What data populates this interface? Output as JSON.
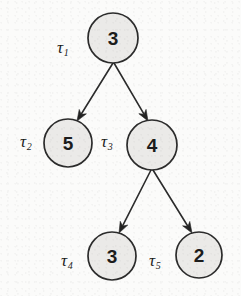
{
  "figure": {
    "type": "tree-diagram",
    "title": "",
    "background_color": "#fbfbfa",
    "node_fill_color": "#ebeae8",
    "node_stroke_color": "#2b2b2b",
    "edge_color": "#2b2b2b",
    "text_color": "#1c1c1c"
  },
  "nodes": [
    {
      "id": "n1",
      "value": "3",
      "tau": "τ",
      "tau_sub": "1",
      "cx": 113,
      "cy": 38,
      "r": 25,
      "label_x": 57,
      "label_y": 39
    },
    {
      "id": "n2",
      "value": "5",
      "tau": "τ",
      "tau_sub": "2",
      "cx": 68,
      "cy": 143,
      "r": 24,
      "label_x": 20,
      "label_y": 133
    },
    {
      "id": "n3",
      "value": "4",
      "tau": "τ",
      "tau_sub": "3",
      "cx": 152,
      "cy": 145,
      "r": 25,
      "label_x": 101,
      "label_y": 133
    },
    {
      "id": "n4",
      "value": "3",
      "tau": "τ",
      "tau_sub": "4",
      "cx": 112,
      "cy": 256,
      "r": 24,
      "label_x": 61,
      "label_y": 252
    },
    {
      "id": "n5",
      "value": "2",
      "tau": "τ",
      "tau_sub": "5",
      "cx": 199,
      "cy": 255,
      "r": 23,
      "label_x": 149,
      "label_y": 252
    }
  ],
  "edges": [
    {
      "id": "e1",
      "from": "n1",
      "to": "n2",
      "x1": 113,
      "y1": 63,
      "x2": 77,
      "y2": 121
    },
    {
      "id": "e2",
      "from": "n1",
      "to": "n3",
      "x1": 114,
      "y1": 63,
      "x2": 148,
      "y2": 121
    },
    {
      "id": "e3",
      "from": "n3",
      "to": "n4",
      "x1": 151,
      "y1": 170,
      "x2": 119,
      "y2": 233
    },
    {
      "id": "e4",
      "from": "n3",
      "to": "n5",
      "x1": 153,
      "y1": 170,
      "x2": 192,
      "y2": 233
    }
  ]
}
